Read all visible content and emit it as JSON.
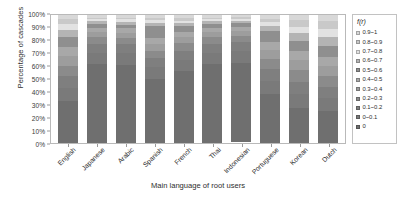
{
  "chart_data": {
    "type": "bar",
    "subtype": "stacked-percentage",
    "title": "",
    "xlabel": "Main language of root users",
    "ylabel": "Percentage of cascades",
    "ylim": [
      0,
      100
    ],
    "ytick_labels": [
      "100%",
      "90%",
      "80%",
      "70%",
      "60%",
      "50%",
      "40%",
      "30%",
      "20%",
      "10%",
      "0%"
    ],
    "ytick_values": [
      100,
      90,
      80,
      70,
      60,
      50,
      40,
      30,
      20,
      10,
      0
    ],
    "grid": false,
    "legend_position": "right",
    "legend_title": "f(r)",
    "categories": [
      "English",
      "Japanese",
      "Arabic",
      "Spanish",
      "French",
      "Thai",
      "Indonesian",
      "Portuguese",
      "Korean",
      "Dutch"
    ],
    "series": [
      {
        "name": "0.9~1",
        "color": "#d8d8d8",
        "values": [
          3.0,
          2.0,
          2.0,
          2.0,
          2.5,
          2.0,
          1.5,
          3.0,
          4.0,
          5.0
        ]
      },
      {
        "name": "0.8~0.9",
        "color": "#c9c9c9",
        "values": [
          4.0,
          1.5,
          1.5,
          2.0,
          2.0,
          1.5,
          1.5,
          2.5,
          5.0,
          6.0
        ]
      },
      {
        "name": "0.7~0.8",
        "color": "#e2e2e2",
        "values": [
          5.0,
          1.5,
          2.0,
          2.0,
          2.0,
          1.5,
          1.5,
          3.0,
          5.0,
          6.0
        ]
      },
      {
        "name": "0.6~0.7",
        "color": "#b4b4b4",
        "values": [
          5.0,
          2.0,
          2.0,
          3.0,
          2.5,
          2.0,
          2.0,
          4.0,
          6.0,
          7.0
        ]
      },
      {
        "name": "0.5~0.6",
        "color": "#8f8f8f",
        "values": [
          8.0,
          3.0,
          3.0,
          9.0,
          4.0,
          3.0,
          3.0,
          9.0,
          8.0,
          9.0
        ]
      },
      {
        "name": "0.4~0.5",
        "color": "#a8a8a8",
        "values": [
          7.0,
          3.5,
          3.5,
          5.0,
          4.0,
          3.5,
          3.0,
          6.0,
          7.0,
          7.0
        ]
      },
      {
        "name": "0.3~0.4",
        "color": "#9d9d9d",
        "values": [
          8.0,
          4.0,
          4.0,
          5.0,
          5.0,
          4.0,
          4.0,
          7.0,
          8.0,
          8.0
        ]
      },
      {
        "name": "0.2~0.3",
        "color": "#8b8b8b",
        "values": [
          8.0,
          5.0,
          5.0,
          6.0,
          6.0,
          5.0,
          5.0,
          8.0,
          9.0,
          8.0
        ]
      },
      {
        "name": "0.1~0.2",
        "color": "#7f7f7f",
        "values": [
          9.0,
          7.0,
          7.0,
          7.0,
          7.0,
          7.0,
          7.0,
          9.0,
          10.0,
          9.0
        ]
      },
      {
        "name": "0~0.1",
        "color": "#7a7a7a",
        "values": [
          10.0,
          9.0,
          9.0,
          9.0,
          9.0,
          9.0,
          9.0,
          10.0,
          11.0,
          10.0
        ]
      },
      {
        "name": "0",
        "color": "#6f6f6f",
        "values": [
          33.0,
          61.5,
          61.0,
          50.0,
          56.0,
          61.5,
          61.5,
          38.5,
          27.0,
          25.0
        ]
      }
    ]
  },
  "axes": {
    "y_title": "Percentage of cascades",
    "x_title": "Main language of root users"
  },
  "legend": {
    "title": "f(r)",
    "items": [
      {
        "label": "0.9~1",
        "color": "#d8d8d8"
      },
      {
        "label": "0.8~0.9",
        "color": "#c9c9c9"
      },
      {
        "label": "0.7~0.8",
        "color": "#e2e2e2"
      },
      {
        "label": "0.6~0.7",
        "color": "#b4b4b4"
      },
      {
        "label": "0.5~0.6",
        "color": "#8f8f8f"
      },
      {
        "label": "0.4~0.5",
        "color": "#a8a8a8"
      },
      {
        "label": "0.3~0.4",
        "color": "#9d9d9d"
      },
      {
        "label": "0.2~0.3",
        "color": "#8b8b8b"
      },
      {
        "label": "0.1~0.2",
        "color": "#7f7f7f"
      },
      {
        "label": "0~0.1",
        "color": "#7a7a7a"
      },
      {
        "label": "0",
        "color": "#6f6f6f"
      }
    ]
  }
}
